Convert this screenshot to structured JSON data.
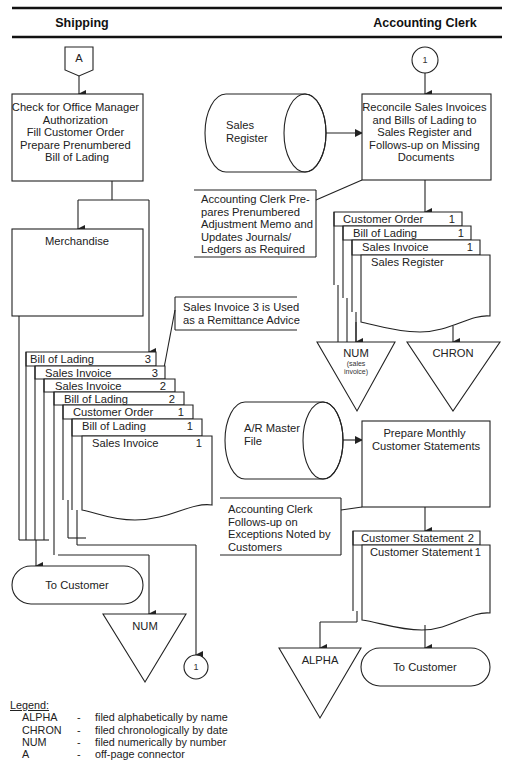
{
  "header": {
    "left_lane": "Shipping",
    "right_lane": "Accounting Clerk"
  },
  "shipping": {
    "offpage_connector": "A",
    "process_box": [
      "Check for Office Manager",
      "Authorization",
      "Fill Customer Order",
      "Prepare  Prenumbered",
      "Bill of Lading"
    ],
    "merchandise_box": "Merchandise",
    "remittance_note": [
      "Sales Invoice 3 is Used",
      "as a Remittance Advice"
    ],
    "documents": [
      {
        "name": "Bill of Lading",
        "copy": "3"
      },
      {
        "name": "Sales Invoice",
        "copy": "3"
      },
      {
        "name": "Sales Invoice",
        "copy": "2"
      },
      {
        "name": "Bill of Lading",
        "copy": "2"
      },
      {
        "name": "Customer Order",
        "copy": "1"
      },
      {
        "name": "Bill of Lading",
        "copy": "1"
      },
      {
        "name": "Sales Invoice",
        "copy": "1"
      }
    ],
    "terminator": "To Customer",
    "file": "NUM",
    "onpage_connector": "1"
  },
  "accounting": {
    "onpage_connector": "1",
    "sales_register_file": [
      "Sales",
      "Register"
    ],
    "reconcile_box": [
      "Reconcile Sales Invoices",
      "and Bills of Lading to",
      "Sales Register and",
      "Follows-up on Missing",
      "Documents"
    ],
    "adjustment_note": [
      "Accounting Clerk Pre-",
      "pares Prenumbered",
      "Adjustment Memo and",
      "Updates Journals/",
      "Ledgers as Required"
    ],
    "documents": [
      {
        "name": "Customer Order",
        "copy": "1"
      },
      {
        "name": "Bill of Lading",
        "copy": "1"
      },
      {
        "name": "Sales Invoice",
        "copy": "1"
      },
      {
        "name": "Sales Register",
        "copy": ""
      }
    ],
    "file_num": "NUM",
    "file_num_sub": [
      "(sales",
      "invoice)"
    ],
    "file_chron": "CHRON",
    "ar_master_file": [
      "A/R Master",
      "File"
    ],
    "statements_box": [
      "Prepare Monthly",
      "Customer Statements"
    ],
    "exceptions_note": [
      "Accounting Clerk",
      "Follows-up on",
      "Exceptions Noted by",
      "Customers"
    ],
    "statements": [
      {
        "name": "Customer Statement",
        "copy": "2"
      },
      {
        "name": "Customer Statement",
        "copy": "1"
      }
    ],
    "file_alpha": "ALPHA",
    "terminator": "To Customer"
  },
  "legend": {
    "title": "Legend:",
    "items": [
      {
        "key": "ALPHA",
        "dash": "-",
        "desc": "filed alphabetically by name"
      },
      {
        "key": "CHRON",
        "dash": "-",
        "desc": "filed chronologically by date"
      },
      {
        "key": "NUM",
        "dash": "-",
        "desc": "filed numerically by number"
      },
      {
        "key": "A",
        "dash": "-",
        "desc": "off-page connector"
      }
    ]
  }
}
